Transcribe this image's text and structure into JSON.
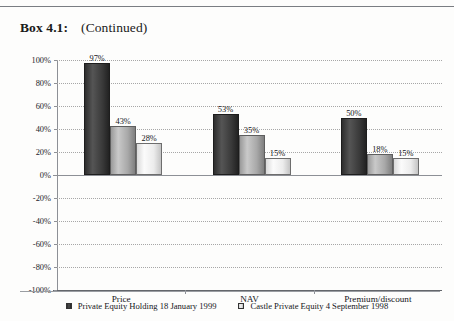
{
  "heading": {
    "box_label": "Box 4.1:",
    "continued_label": "(Continued)"
  },
  "chart_data": {
    "type": "bar",
    "title": "",
    "subtitle": "",
    "xlabel": "",
    "ylabel": "",
    "ylim": [
      -100,
      100
    ],
    "ytick_labels": [
      "100%",
      "80%",
      "60%",
      "40%",
      "20%",
      "0%",
      "-20%",
      "-40%",
      "-60%",
      "-80%",
      "-100%"
    ],
    "ytick_values": [
      100,
      80,
      60,
      40,
      20,
      0,
      -20,
      -40,
      -60,
      -80,
      -100
    ],
    "grid": true,
    "legend_position": "bottom",
    "categories": [
      "Price",
      "NAV",
      "Premium/discount"
    ],
    "series": [
      {
        "name": "Private Equity Holding  18 January 1999",
        "values": [
          97,
          53,
          50
        ],
        "labels": [
          "97%",
          "53%",
          "50%"
        ],
        "color": "#2e2e2e"
      },
      {
        "name": "series-2-unlabelled",
        "values": [
          43,
          35,
          18
        ],
        "labels": [
          "43%",
          "35%",
          "18%"
        ],
        "color": "#a8a8a8"
      },
      {
        "name": "Castle Private Equity 4 September 1998",
        "values": [
          28,
          15,
          15
        ],
        "labels": [
          "28%",
          "15%",
          "15%"
        ],
        "color": "#ececec"
      }
    ]
  },
  "legend": {
    "items": [
      {
        "label": "Private Equity Holding  18 January 1999",
        "swatch": "dark-square"
      },
      {
        "label": "Castle Private Equity 4 September 1998",
        "swatch": "light-square"
      }
    ]
  }
}
